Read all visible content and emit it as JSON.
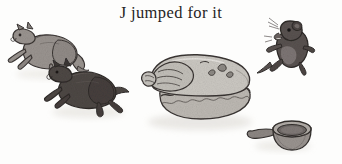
{
  "page": {
    "width": 342,
    "height": 164,
    "background_color": "#fdfdfc",
    "caption": "J jumped for it",
    "caption_color": "#262424"
  },
  "illustration": {
    "name": "alphabet-book-illustration",
    "description": "Two cats leap toward a pie while a mouse leaps away; a small pan lies beside the pie.",
    "palette": {
      "ink": "#3a3533",
      "cat_light_fill": "#9a9490",
      "cat_dark_fill": "#4e4845",
      "mouse_fill": "#595250",
      "pie_fill": "#c9c6c0",
      "pie_shadow": "#b4b0a9",
      "pan_fill": "#8d8783",
      "ground_shadow": "#d9d6d0"
    },
    "figures": [
      {
        "name": "leaping-cat-upper",
        "label": "Leaping cat (light gray)",
        "x": 10,
        "y": 30,
        "width": 72,
        "height": 44,
        "fill": "#9a9490"
      },
      {
        "name": "leaping-cat-lower",
        "label": "Leaping cat (dark gray)",
        "x": 48,
        "y": 68,
        "width": 78,
        "height": 46,
        "fill": "#4e4845"
      },
      {
        "name": "pie",
        "label": "Pie with crimped crust",
        "x": 140,
        "y": 55,
        "width": 118,
        "height": 68,
        "fill": "#c9c6c0"
      },
      {
        "name": "leaping-mouse",
        "label": "Leaping mouse",
        "x": 268,
        "y": 24,
        "width": 46,
        "height": 50,
        "fill": "#595250"
      },
      {
        "name": "pan",
        "label": "Small pan with handle",
        "x": 248,
        "y": 120,
        "width": 68,
        "height": 32,
        "fill": "#8d8783"
      }
    ]
  }
}
